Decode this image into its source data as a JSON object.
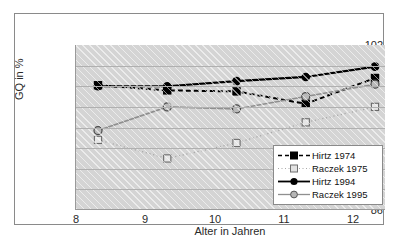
{
  "chart_data": {
    "type": "line",
    "title": "",
    "xlabel": "Alter in Jahren",
    "ylabel": "GQ in %",
    "x": [
      8,
      9,
      10,
      11,
      12
    ],
    "xtick_labels": [
      "8",
      "9",
      "10",
      "11",
      "12"
    ],
    "ytick_labels": [
      "86",
      "88",
      "90",
      "92",
      "94",
      "96",
      "98",
      "100",
      "102"
    ],
    "yticks": [
      86,
      88,
      90,
      92,
      94,
      96,
      98,
      100,
      102
    ],
    "ylim": [
      86,
      102
    ],
    "xlim": [
      8,
      12
    ],
    "grid": true,
    "legend_position": "inside-bottom-right",
    "plot_background": "#d4d4d4",
    "series": [
      {
        "name": "Hirtz 1974",
        "values": [
          98.1,
          97.6,
          97.5,
          96.3,
          98.8
        ],
        "color": "#000000",
        "line_style": "dashed",
        "marker": "filled-square"
      },
      {
        "name": "Raczek 1975",
        "values": [
          92.8,
          91.0,
          92.5,
          94.5,
          96.0
        ],
        "color": "#a8a8a8",
        "line_style": "dotted",
        "marker": "open-square"
      },
      {
        "name": "Hirtz 1994",
        "values": [
          98.0,
          98.0,
          98.5,
          98.9,
          99.9
        ],
        "color": "#000000",
        "line_style": "solid",
        "marker": "filled-circle"
      },
      {
        "name": "Raczek 1995",
        "values": [
          93.7,
          96.0,
          95.8,
          97.0,
          98.2
        ],
        "color": "#8f8f8f",
        "line_style": "solid",
        "marker": "gray-circle"
      }
    ]
  },
  "legend": {
    "entries": [
      {
        "label": "Hirtz 1974"
      },
      {
        "label": "Raczek 1975"
      },
      {
        "label": "Hirtz 1994"
      },
      {
        "label": "Raczek 1995"
      }
    ]
  }
}
